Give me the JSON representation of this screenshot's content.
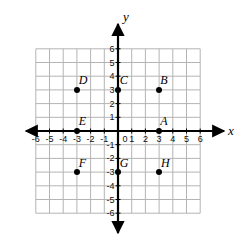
{
  "chart_data": {
    "type": "scatter",
    "title": "",
    "xlabel": "x",
    "ylabel": "y",
    "xlim": [
      -6,
      6
    ],
    "ylim": [
      -6,
      6
    ],
    "grid": true,
    "legend": "none",
    "x_ticks": [
      "-6",
      "-5",
      "-4",
      "-3",
      "-2",
      "-1",
      "0",
      "1",
      "2",
      "3",
      "4",
      "5",
      "6"
    ],
    "y_ticks": [
      "6",
      "5",
      "4",
      "3",
      "2",
      "1",
      "-1",
      "-2",
      "-3",
      "-4",
      "-5",
      "-6"
    ],
    "points": [
      {
        "label": "A",
        "x": 3,
        "y": 0,
        "lx": 3.35,
        "ly": 0.72
      },
      {
        "label": "B",
        "x": 3,
        "y": 3,
        "lx": 3.35,
        "ly": 3.72
      },
      {
        "label": "C",
        "x": 0,
        "y": 3,
        "lx": 0.42,
        "ly": 3.72
      },
      {
        "label": "D",
        "x": -3,
        "y": 3,
        "lx": -2.55,
        "ly": 3.72
      },
      {
        "label": "E",
        "x": -3,
        "y": 0,
        "lx": -2.6,
        "ly": 0.72
      },
      {
        "label": "F",
        "x": -3,
        "y": -3,
        "lx": -2.6,
        "ly": -2.3
      },
      {
        "label": "G",
        "x": 0,
        "y": -3,
        "lx": 0.45,
        "ly": -2.3
      },
      {
        "label": "H",
        "x": 3,
        "y": -3,
        "lx": 3.45,
        "ly": -2.3
      }
    ]
  },
  "axes": {
    "x_name": "x",
    "y_name": "y",
    "origin_label": "0"
  },
  "colors": {
    "axis": "#000000",
    "grid": "#b4b4b4",
    "point": "#000000",
    "background": "#ffffff"
  }
}
